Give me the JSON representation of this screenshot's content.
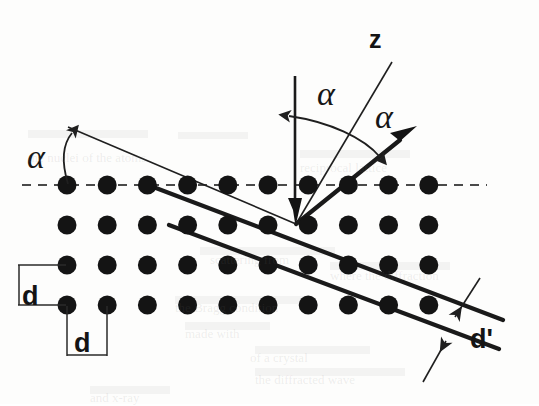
{
  "figure": {
    "background_color": "#fdfdfc",
    "ink_color": "#141414"
  },
  "labels": {
    "axis_z": "z",
    "alpha_left": "α",
    "alpha_incident": "α",
    "alpha_scattered": "α",
    "spacing_vertical": "d",
    "spacing_horizontal": "d",
    "spacing_planes": "d'"
  },
  "geometry": {
    "lattice": {
      "columns": 10,
      "rows": 4,
      "x_start": 67,
      "y_start": 185,
      "x_spacing": 40.2,
      "y_spacing": 40,
      "dot_radius": 9.5,
      "dot_color": "#141414"
    },
    "surface_dashed_line": {
      "x1": 22,
      "y1": 185,
      "x2": 487,
      "y2": 185
    },
    "z_axis": {
      "x1": 295,
      "y1": 76,
      "x2": 295,
      "y2": 224,
      "arrow": "down"
    },
    "incident_beam": {
      "x1": 68,
      "y1": 127,
      "x2": 296,
      "y2": 224
    },
    "incident_beam_upper": {
      "x1": 296,
      "y1": 224,
      "x2": 392,
      "y2": 62
    },
    "scattered_beam": {
      "x1": 296,
      "y1": 224,
      "x2": 414,
      "y2": 128,
      "arrow": "up-right"
    },
    "scatter_point": {
      "x": 296,
      "y": 224
    },
    "bragg_plane_1": {
      "x1": 148,
      "y1": 185,
      "x2": 500,
      "y2": 318
    },
    "bragg_plane_2": {
      "x1": 170,
      "y1": 225,
      "x2": 497,
      "y2": 347
    },
    "alpha_left_arc": {
      "from_x": 68,
      "from_y": 185,
      "to_x": 74,
      "to_y": 131
    },
    "alpha_center_arc": {
      "from_x": 288,
      "from_y": 116,
      "to_x": 377,
      "to_y": 155
    }
  },
  "label_positions": {
    "axis_z": {
      "x": 378,
      "y": 48
    },
    "alpha_left": {
      "x": 39,
      "y": 167
    },
    "alpha_incident": {
      "x": 328,
      "y": 103
    },
    "alpha_scattered": {
      "x": 386,
      "y": 125
    },
    "spacing_vertical": {
      "x": 27,
      "y": 306
    },
    "spacing_horizontal": {
      "x": 76,
      "y": 348
    },
    "spacing_planes": {
      "x": 477,
      "y": 348
    }
  },
  "background_ghost_text": [
    {
      "text": "the nuclei of the atoms",
      "x": 28,
      "y": 150
    },
    {
      "text": "reciprocal lattice",
      "x": 300,
      "y": 160
    },
    {
      "text": "scattering from",
      "x": 210,
      "y": 252
    },
    {
      "text": "where the diffraction",
      "x": 330,
      "y": 268
    },
    {
      "text": "the Bragg condition",
      "x": 175,
      "y": 300
    },
    {
      "text": "made with",
      "x": 185,
      "y": 326
    },
    {
      "text": "of a crystal",
      "x": 250,
      "y": 350
    },
    {
      "text": "the diffracted wave",
      "x": 255,
      "y": 372
    },
    {
      "text": "and x-ray",
      "x": 90,
      "y": 390
    }
  ]
}
